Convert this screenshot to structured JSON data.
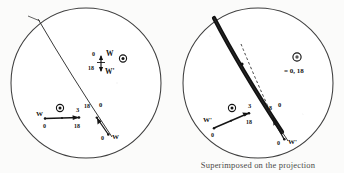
{
  "figure": {
    "caption_right": "figure caption partially cut off",
    "background_color": "#fbfbfa",
    "ink_color": "#141414"
  },
  "panels": [
    {
      "id": "left",
      "name": "left-projection-circle",
      "circle": {
        "cx": 86,
        "cy": 83,
        "r": 75,
        "stroke": "#3a3a3a"
      },
      "great_circle": {
        "name": "great-circle-trace",
        "x1": 38,
        "y1": 19,
        "x2": 112,
        "y2": 137,
        "shaded": false
      },
      "dashed_line": null,
      "vector": {
        "name": "w-vector-arrow",
        "x1": 45,
        "y1": 119,
        "x2": 77,
        "y2": 117,
        "label_head": "W",
        "label_start": "0",
        "label_end": "18",
        "label_above_end": "3"
      },
      "second_vector": {
        "name": "w-prime-vector-arrow",
        "x1": 108,
        "y1": 135,
        "x2": 96,
        "y2": 118,
        "label_head": "W",
        "label_start": "0",
        "label_end": "18"
      },
      "cluster": {
        "name": "w-wprime-label-cluster",
        "label_top": "W",
        "label_bottom": "W'",
        "label_left_top": "0",
        "label_left_bottom": "18"
      },
      "symbols": [
        {
          "name": "circled-dot-center",
          "glyph": "circled-dot",
          "x": 60,
          "y": 108
        },
        {
          "name": "circled-dot-upper-right",
          "glyph": "circled-dot",
          "x": 123,
          "y": 59
        }
      ],
      "tick_labels": [
        "18",
        "0"
      ],
      "caption": ""
    },
    {
      "id": "right",
      "name": "right-projection-circle",
      "circle": {
        "cx": 86,
        "cy": 83,
        "r": 75,
        "stroke": "#3a3a3a"
      },
      "great_circle": {
        "name": "shaded-great-circle-band",
        "x1": 42,
        "y1": 18,
        "x2": 112,
        "y2": 132,
        "shaded": true
      },
      "dashed_line": {
        "name": "dashed-reference-line",
        "x1": 68,
        "y1": 46,
        "x2": 98,
        "y2": 112
      },
      "vector": {
        "name": "w-prime-vector-arrow",
        "x1": 42,
        "y1": 128,
        "x2": 74,
        "y2": 114,
        "label_head": "W'",
        "label_start": "0",
        "label_end": "18",
        "label_above_end": "3"
      },
      "second_vector": {
        "name": "w-prime-vector-arrow-lower",
        "x1": 110,
        "y1": 136,
        "x2": 100,
        "y2": 117,
        "label_head": "W'",
        "label_start": "0",
        "label_end": "18"
      },
      "cluster": null,
      "symbols": [
        {
          "name": "circled-dot-center",
          "glyph": "circled-dot",
          "x": 60,
          "y": 108
        },
        {
          "name": "circled-dot-legend",
          "glyph": "circled-dot",
          "x": 125,
          "y": 57
        }
      ],
      "legend": {
        "name": "legend-equals-label",
        "text": "= 0, 18"
      },
      "tick_labels": [
        "18",
        "0"
      ],
      "caption": "Superimposed on the projection"
    }
  ],
  "annotations": {
    "left": {
      "cluster_top": "W",
      "cluster_bottom": "W'",
      "cluster_zero": "0",
      "cluster_eighteen": "18",
      "vector_label_w": "W",
      "vector_zero": "0",
      "vector_eighteen": "18",
      "vector_three": "3",
      "trace_eighteen": "18",
      "trace_zero": "0",
      "lower_zero": "0",
      "lower_w": "W"
    },
    "right": {
      "vector_label_wprime": "W'",
      "vector_zero": "0",
      "vector_eighteen": "18",
      "vector_three": "3",
      "trace_eighteen": "18",
      "trace_zero": "0",
      "lower_zero": "0",
      "lower_wprime": "W'",
      "legend_text": "= 0, 18"
    }
  }
}
